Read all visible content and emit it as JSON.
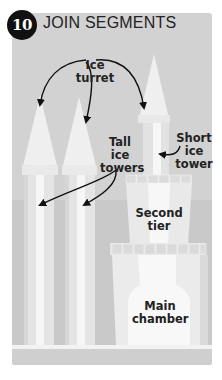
{
  "step": {
    "number": "10",
    "title": "JOIN SEGMENTS"
  },
  "labels": {
    "ice_turret": [
      "Ice",
      "turret"
    ],
    "tall_ice_towers": [
      "Tall",
      "ice",
      "towers"
    ],
    "short_ice_tower": [
      "Short",
      "ice",
      "tower"
    ],
    "second_tier": [
      "Second",
      "tier"
    ],
    "main_chamber": [
      "Main",
      "chamber"
    ]
  },
  "colors": {
    "panel": "#d2d2d2",
    "ice_light": "#f4f4f4",
    "ice_mid": "#e6e6e6",
    "ice_shadow": "#c2c2c2",
    "badge": "#111111",
    "text": "#222222"
  }
}
